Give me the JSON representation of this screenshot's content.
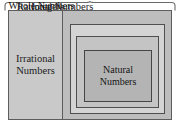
{
  "diagram": {
    "type": "nested-set-diagram",
    "brace": {
      "name": "top-brace",
      "orientation": "up",
      "label": ""
    },
    "sets": {
      "irrational": {
        "label_line1": "Irrational",
        "label_line2": "Numbers",
        "fill": "#c9c9c9"
      },
      "rational": {
        "label": "Rational Numbers",
        "fill": "#bdbdbd"
      },
      "integers": {
        "label": "Integers",
        "fill": "#d4d4d4"
      },
      "whole": {
        "label": "Whole Numbers",
        "fill": "#c4c4c4"
      },
      "natural": {
        "label_line1": "Natural",
        "label_line2": "Numbers",
        "fill": "#b4b4b4"
      }
    },
    "colors": {
      "border": "#5d5d5d",
      "text": "#1c1c1c",
      "background": "#ffffff"
    }
  }
}
